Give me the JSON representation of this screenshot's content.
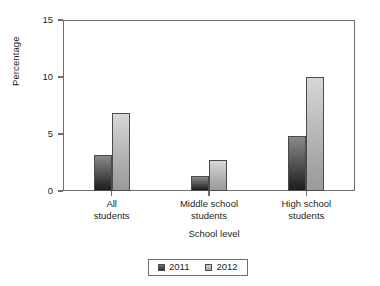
{
  "chart_data": {
    "type": "bar",
    "title": "",
    "xlabel": "School level",
    "ylabel": "Percentage",
    "categories": [
      "All students",
      "Middle school students",
      "High school students"
    ],
    "category_lines": [
      [
        "All",
        "students"
      ],
      [
        "Middle school",
        "students"
      ],
      [
        "High school",
        "students"
      ]
    ],
    "series": [
      {
        "name": "2011",
        "values": [
          3.2,
          1.3,
          4.8
        ],
        "color": "#4b4b4d"
      },
      {
        "name": "2012",
        "values": [
          6.8,
          2.7,
          10.0
        ],
        "color": "#b4b4b4"
      }
    ],
    "ylim": [
      0,
      15
    ],
    "yticks": [
      0,
      5,
      10,
      15
    ],
    "ytick_labels": [
      "0",
      "5",
      "10",
      "15"
    ],
    "grid": false,
    "legend_position": "bottom-center",
    "axis_color": "#6d6e71"
  }
}
